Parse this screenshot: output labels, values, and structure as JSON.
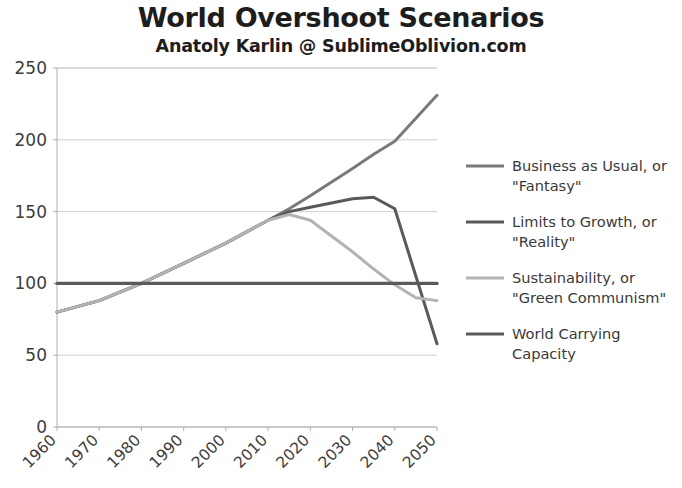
{
  "chart_data": {
    "type": "line",
    "title": "World Overshoot Scenarios",
    "subtitle": "Anatoly Karlin @ SublimeOblivion.com",
    "xlabel": "",
    "ylabel": "",
    "xlim": [
      1960,
      2050
    ],
    "ylim": [
      0,
      250
    ],
    "ytick_labels": [
      "250",
      "200",
      "150",
      "100",
      "50",
      "0"
    ],
    "ytick_values": [
      250,
      200,
      150,
      100,
      50,
      0
    ],
    "xtick_labels": [
      "1960",
      "1970",
      "1980",
      "1990",
      "2000",
      "2010",
      "2020",
      "2030",
      "2040",
      "2050"
    ],
    "xtick_values": [
      1960,
      1970,
      1980,
      1990,
      2000,
      2010,
      2020,
      2030,
      2040,
      2050
    ],
    "grid": true,
    "legend_position": "right",
    "x": [
      1960,
      1970,
      1980,
      1990,
      2000,
      2010,
      2015,
      2020,
      2030,
      2035,
      2040,
      2045,
      2050
    ],
    "series": [
      {
        "name": "Business as Usual, or \"Fantasy\"",
        "color": "#7a7a7a",
        "values": [
          80,
          88,
          100,
          114,
          128,
          144,
          152,
          161,
          180,
          190,
          199,
          215,
          231
        ]
      },
      {
        "name": "Limits to Growth, or \"Reality\"",
        "color": "#595959",
        "values": [
          80,
          88,
          100,
          114,
          128,
          144,
          150,
          153,
          159,
          160,
          152,
          105,
          58
        ]
      },
      {
        "name": "Sustainability, or \"Green Communism\"",
        "color": "#b3b3b3",
        "values": [
          80,
          88,
          100,
          114,
          128,
          144,
          148,
          144,
          122,
          110,
          99,
          90,
          88
        ]
      },
      {
        "name": "World Carrying Capacity",
        "color": "#5a5a5a",
        "values": [
          100,
          100,
          100,
          100,
          100,
          100,
          100,
          100,
          100,
          100,
          100,
          100,
          100
        ]
      }
    ]
  },
  "legend": {
    "items": [
      {
        "label_line1": "Business as Usual, or",
        "label_line2": "\"Fantasy\"",
        "color": "#7a7a7a"
      },
      {
        "label_line1": "Limits to Growth, or",
        "label_line2": "\"Reality\"",
        "color": "#595959"
      },
      {
        "label_line1": "Sustainability, or",
        "label_line2": "\"Green Communism\"",
        "color": "#b3b3b3"
      },
      {
        "label_line1": "World Carrying",
        "label_line2": "Capacity",
        "color": "#5a5a5a"
      }
    ]
  },
  "colors": {
    "background": "#ffffff",
    "grid": "#c9c9c9",
    "axis": "#b0b0b0",
    "text": "#3a3a3a",
    "title": "#1d1d1d"
  }
}
